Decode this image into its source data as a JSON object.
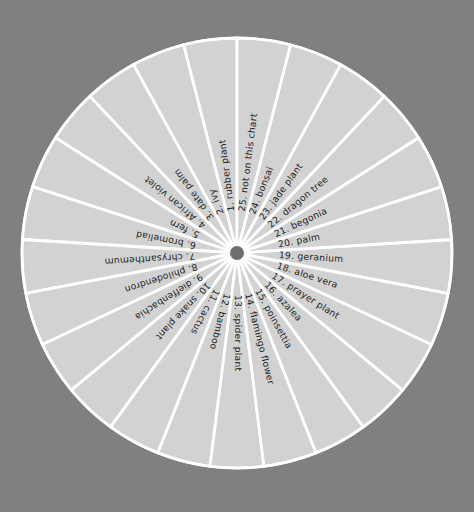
{
  "figure": {
    "background_color": "#808080",
    "slice_fill_color": "#d2d2d2",
    "separator_color": "#ffffff",
    "hub_color": "#6f6f6f",
    "label_color": "#1d1d1d",
    "center_x": 237,
    "center_y": 253,
    "radius": 215,
    "hub_radius": 7
  },
  "chart_data": {
    "type": "pie",
    "title": "",
    "xlabel": "",
    "ylabel": "",
    "legend": "none",
    "grid": false,
    "slice_count": 25,
    "equal_slices": true,
    "slice_angle_degrees": 14.4,
    "start_angle_degrees": 90,
    "direction": "counterclockwise",
    "categories": [
      "rubber plant",
      "ivy",
      "date palm",
      "African violet",
      "fern",
      "bromeliad",
      "chrysanthemum",
      "philodendron",
      "dieffenbachia",
      "snake plant",
      "cactus",
      "bamboo",
      "spider plant",
      "flamingo flower",
      "poinsettia",
      "azalea",
      "prayer plant",
      "aloe vera",
      "geranium",
      "palm",
      "begonia",
      "dragon tree",
      "jade plant",
      "bonsai",
      "not on this chart"
    ],
    "values": [
      4,
      4,
      4,
      4,
      4,
      4,
      4,
      4,
      4,
      4,
      4,
      4,
      4,
      4,
      4,
      4,
      4,
      4,
      4,
      4,
      4,
      4,
      4,
      4,
      4
    ],
    "labels": [
      "1.  rubber plant",
      "2.  ivy",
      "3.  date palm",
      "4.  African violet",
      "5.  fern",
      "6.  bromeliad",
      "7.  chrysanthemum",
      "8.  philodendron",
      "9.  dieffenbachia",
      "10.  snake plant",
      "11.  cactus",
      "12.  bamboo",
      "13.  spider plant",
      "14.  flamingo flower",
      "15.  poinsettia",
      "16.  azalea",
      "17.  prayer plant",
      "18.  aloe vera",
      "19.  geranium",
      "20.  palm",
      "21.  begonia",
      "22.  dragon tree",
      "23.  jade plant",
      "24.  bonsai",
      "25.  not on this chart"
    ]
  }
}
